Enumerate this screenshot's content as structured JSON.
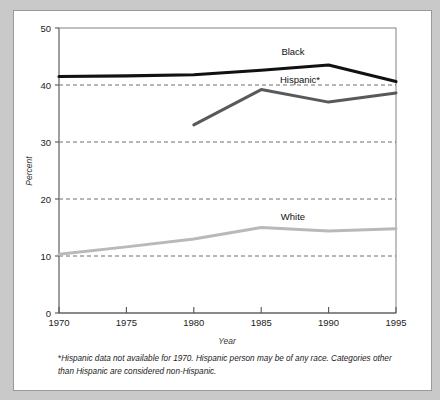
{
  "chart_data": {
    "type": "line",
    "title": "",
    "xlabel": "Year",
    "ylabel": "Percent",
    "x": [
      1970,
      1975,
      1980,
      1985,
      1990,
      1995
    ],
    "xlim": [
      1970,
      1995
    ],
    "ylim": [
      0,
      50
    ],
    "yticks": [
      0,
      10,
      20,
      30,
      40,
      50
    ],
    "xticks": [
      1970,
      1975,
      1980,
      1985,
      1990,
      1995
    ],
    "ytick_labels": [
      "0",
      "10",
      "20",
      "30",
      "40",
      "50"
    ],
    "xtick_labels": [
      "1970",
      "1975",
      "1980",
      "1985",
      "1990",
      "1995"
    ],
    "grid": "horizontal-dashed",
    "gridlines": [
      10,
      20,
      30,
      40
    ],
    "legend": "inline-labels",
    "series": [
      {
        "name": "Black",
        "label": "Black",
        "color": "#111111",
        "width": 3.1,
        "x": [
          1970,
          1975,
          1980,
          1985,
          1990,
          1995
        ],
        "values": [
          41.5,
          41.6,
          41.8,
          42.6,
          43.5,
          40.6
        ]
      },
      {
        "name": "Hispanic*",
        "label": "Hispanic*",
        "color": "#59595b",
        "width": 3.0,
        "x": [
          1980,
          1985,
          1990,
          1995
        ],
        "values": [
          33.0,
          39.2,
          37.0,
          38.6
        ]
      },
      {
        "name": "White",
        "label": "White",
        "color": "#b9b9b9",
        "width": 3.0,
        "x": [
          1970,
          1975,
          1980,
          1985,
          1990,
          1995
        ],
        "values": [
          10.3,
          11.6,
          13.0,
          15.0,
          14.4,
          14.8
        ]
      }
    ],
    "annotations": [
      {
        "text": "Black",
        "x": 1987.0,
        "y": 45.6
      },
      {
        "text": "Hispanic*",
        "x": 1987.3,
        "y": 40.6
      },
      {
        "text": "White",
        "x": 1987.0,
        "y": 16.9
      }
    ]
  },
  "footnote": {
    "marker": "*",
    "text": "Hispanic data not available for 1970. Hispanic person may be of any race. Categories other than Hispanic are considered non-Hispanic."
  },
  "colors": {
    "frame": "#c9c9c9",
    "panel": "#ffffff",
    "axis": "#8d8d8d",
    "grid": "#555555",
    "black_series": "#111111",
    "hispanic_series": "#59595b",
    "white_series": "#b9b9b9"
  }
}
